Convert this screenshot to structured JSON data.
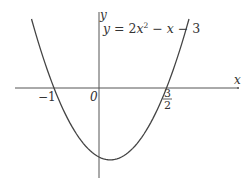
{
  "chart_data": {
    "type": "line",
    "title": "",
    "equation": {
      "lhs": "y",
      "eq": " = 2",
      "var1": "x",
      "exp": "2",
      "minus1": " − ",
      "var2": "x",
      "rest": " − 3"
    },
    "equation_text": "y = 2x² − x − 3",
    "xlabel": "x",
    "ylabel": "y",
    "origin_label": "0",
    "x_intercepts": [
      {
        "x": -1,
        "label": "−1"
      },
      {
        "x": 1.5,
        "label_num": "3",
        "label_den": "2"
      }
    ],
    "vertex": {
      "x": 0.25,
      "y": -3.125
    },
    "xlim": [
      -1.9,
      3.3
    ],
    "ylim": [
      -3.8,
      3.2
    ],
    "grid": false,
    "series": [
      {
        "name": "y = 2x^2 - x - 3",
        "x": [
          -1.5,
          -1,
          -0.5,
          0,
          0.25,
          0.5,
          1,
          1.5,
          2
        ],
        "y": [
          3,
          0,
          -2,
          -3,
          -3.125,
          -3,
          -2,
          0,
          3
        ]
      }
    ],
    "colors": {
      "axis": "#555555",
      "curve": "#444444",
      "text": "#333333"
    }
  }
}
